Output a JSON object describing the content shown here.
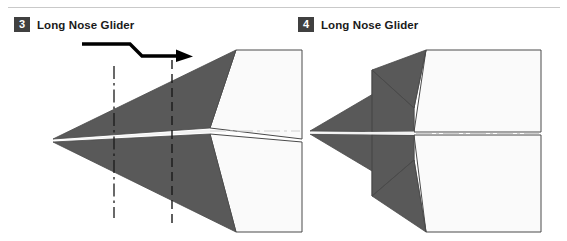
{
  "page": {
    "width": 567,
    "height": 241,
    "background": "#ffffff",
    "top_rule_color": "#c9c9c9"
  },
  "colors": {
    "paper_shaded": "#595959",
    "paper_light": "#fafafa",
    "outline": "#4a4a4a",
    "fold_line": "#1a1a1a",
    "center_line": "#cfcfcf",
    "badge_background": "#404040",
    "badge_text": "#ffffff",
    "title_text": "#1a1a1a",
    "arrow": "#000000"
  },
  "steps": [
    {
      "number": "3",
      "title": "Long Nose Glider",
      "icons": {
        "pleat_arrow": "pleat-fold-arrow-icon",
        "mountain_fold": "dash-dot-fold-line-icon",
        "valley_fold": "dashed-fold-line-icon",
        "center_line": "dash-dot-center-line-icon"
      },
      "annotations": {
        "arrow_label": "Z-shaped pleat fold arrow pointing right",
        "mountain_fold_x": 114,
        "valley_fold_x": 172
      }
    },
    {
      "number": "4",
      "title": "Long Nose Glider",
      "icons": {
        "center_line": "dash-dot-center-line-icon"
      },
      "annotations": {
        "result_label": "Pleat completed, nose shortened"
      }
    }
  ],
  "figures": {
    "left": {
      "name": "long-nose-glider-step-3-diagram",
      "viewbox": "0 0 288 190",
      "nose_tip": [
        39,
        105
      ],
      "body_shaded_upper": "39,105 222,10 238,10 195,92",
      "body_shaded_lower": "39,105 222,198 238,198 195,118",
      "paper_right_edge_x": 288,
      "shapes": {
        "light_upper": "222,10 288,10 288,104 195,92",
        "light_lower": "222,198 288,198 288,106 195,118"
      }
    },
    "right": {
      "name": "long-nose-glider-step-4-diagram",
      "viewbox": "0 0 250 190",
      "nose_tip": [
        12,
        96
      ],
      "pleat_fold_x": 100,
      "paper_right_edge_x": 243
    }
  }
}
